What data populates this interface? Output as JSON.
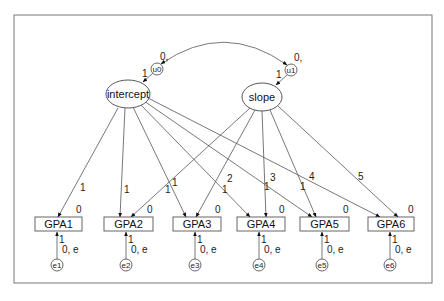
{
  "diagram": {
    "type": "latent growth curve path diagram",
    "latents": [
      {
        "id": "intercept",
        "label": "intercept"
      },
      {
        "id": "slope",
        "label": "slope"
      }
    ],
    "disturbances": [
      {
        "id": "u0",
        "label": "u0",
        "mean_label": "0,",
        "path_label": "1",
        "target": "intercept"
      },
      {
        "id": "u1",
        "label": "u1",
        "mean_label": "0,",
        "path_label": "1",
        "target": "slope"
      }
    ],
    "covariance": {
      "from": "u0",
      "to": "u1"
    },
    "observed": [
      {
        "id": "GPA1",
        "label": "GPA1",
        "intercept_label": "0"
      },
      {
        "id": "GPA2",
        "label": "GPA2",
        "intercept_label": "0"
      },
      {
        "id": "GPA3",
        "label": "GPA3",
        "intercept_label": "0"
      },
      {
        "id": "GPA4",
        "label": "GPA4",
        "intercept_label": "0"
      },
      {
        "id": "GPA5",
        "label": "GPA5",
        "intercept_label": "0"
      },
      {
        "id": "GPA6",
        "label": "GPA6",
        "intercept_label": "0"
      }
    ],
    "errors": [
      {
        "id": "e1",
        "label": "e1",
        "path_label": "1",
        "var_label": "0, e"
      },
      {
        "id": "e2",
        "label": "e2",
        "path_label": "1",
        "var_label": "0, e"
      },
      {
        "id": "e3",
        "label": "e3",
        "path_label": "1",
        "var_label": "0, e"
      },
      {
        "id": "e4",
        "label": "e4",
        "path_label": "1",
        "var_label": "0, e"
      },
      {
        "id": "e5",
        "label": "e5",
        "path_label": "1",
        "var_label": "0, e"
      },
      {
        "id": "e6",
        "label": "e6",
        "path_label": "1",
        "var_label": "0, e"
      }
    ],
    "intercept_loadings": [
      "1",
      "1",
      "1",
      "1",
      "1",
      "1"
    ],
    "slope_loadings": [
      "0",
      "1",
      "2",
      "3",
      "4",
      "5"
    ]
  }
}
